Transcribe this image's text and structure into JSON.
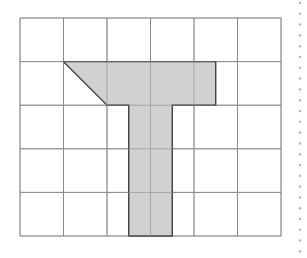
{
  "diagram": {
    "type": "grid-shape",
    "grid": {
      "columns": 6,
      "rows": 5,
      "line_color": "#8a8a8a"
    },
    "shape": {
      "name": "T-shaped polygon",
      "fill": "#cfcfcf",
      "stroke": "#333333",
      "vertices_grid_units": [
        [
          1,
          1
        ],
        [
          4.5,
          1
        ],
        [
          4.5,
          2
        ],
        [
          3.5,
          2
        ],
        [
          3.5,
          5
        ],
        [
          2.5,
          5
        ],
        [
          2.5,
          2
        ],
        [
          2,
          2
        ]
      ]
    },
    "margin_dots": {
      "color": "#bbbbbb",
      "count": 24
    }
  }
}
